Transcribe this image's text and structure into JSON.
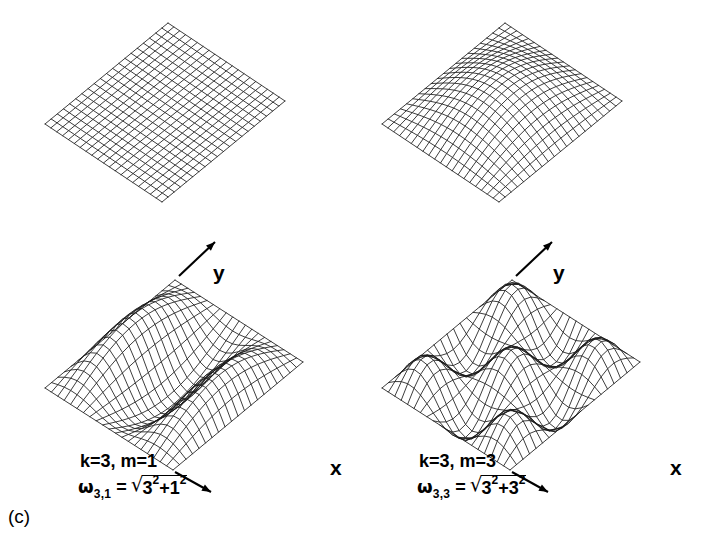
{
  "figure": {
    "letter": "(c)",
    "background_color": "#ffffff",
    "line_color": "#1a1a1a"
  },
  "panels": [
    {
      "id": "panel-tl",
      "position": "top-left",
      "axes_shown": false,
      "x_axis_label": "",
      "y_axis_label": "",
      "mode_label": "",
      "formula": null,
      "chart_data": {
        "type": "surface",
        "k": 0,
        "m": 0,
        "amplitude": 0.0,
        "grid_nx": 20,
        "grid_ny": 20,
        "title": "",
        "xlabel": "x",
        "ylabel": "y",
        "zlabel": "",
        "note": "flat undeformed membrane grid"
      }
    },
    {
      "id": "panel-tr",
      "position": "top-right",
      "axes_shown": false,
      "x_axis_label": "",
      "y_axis_label": "",
      "mode_label": "",
      "formula": null,
      "chart_data": {
        "type": "surface",
        "k": 1,
        "m": 1,
        "amplitude": 0.62,
        "grid_nx": 20,
        "grid_ny": 20,
        "title": "",
        "xlabel": "x",
        "ylabel": "y",
        "zlabel": "",
        "note": "fundamental (1,1) mode, single central antinode"
      }
    },
    {
      "id": "panel-bl",
      "position": "bottom-left",
      "axes_shown": true,
      "x_axis_label": "x",
      "y_axis_label": "y",
      "mode_label": "k=3, m=1",
      "formula": {
        "omega": "ω",
        "subscript": "3,1",
        "equals": "=",
        "radical": "√",
        "term1_base": "3",
        "term1_exp": "2",
        "plus": "+",
        "term2_base": "1",
        "term2_exp": "2"
      },
      "chart_data": {
        "type": "surface",
        "k": 3,
        "m": 1,
        "amplitude": 0.6,
        "grid_nx": 20,
        "grid_ny": 20,
        "title": "k=3, m=1",
        "xlabel": "x",
        "ylabel": "y",
        "zlabel": "",
        "omega_value": 3.1623,
        "note": "(3,1) mode: 3 half-waves along x, 1 along y"
      }
    },
    {
      "id": "panel-br",
      "position": "bottom-right",
      "axes_shown": true,
      "x_axis_label": "x",
      "y_axis_label": "y",
      "mode_label": "k=3, m=3",
      "formula": {
        "omega": "ω",
        "subscript": "3,3",
        "equals": "=",
        "radical": "√",
        "term1_base": "3",
        "term1_exp": "2",
        "plus": "+",
        "term2_base": "3",
        "term2_exp": "2"
      },
      "chart_data": {
        "type": "surface",
        "k": 3,
        "m": 3,
        "amplitude": 0.52,
        "grid_nx": 20,
        "grid_ny": 20,
        "title": "k=3, m=3",
        "xlabel": "x",
        "ylabel": "y",
        "zlabel": "",
        "omega_value": 4.2426,
        "note": "(3,3) mode: 3 half-waves along x and y"
      }
    }
  ],
  "projection": {
    "note": "isometric-like projection used for all four meshes",
    "axis_arrow_color": "#000000"
  }
}
